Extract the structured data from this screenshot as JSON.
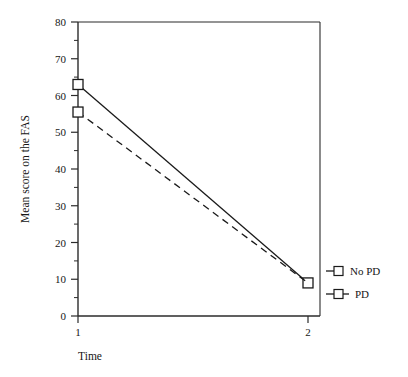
{
  "chart_data": {
    "type": "line",
    "title": "",
    "xlabel": "Time",
    "ylabel": "Mean score on the FAS",
    "x": [
      1,
      2
    ],
    "xticklabels": [
      "1",
      "2"
    ],
    "xlim": [
      1,
      2
    ],
    "ylim": [
      0,
      80
    ],
    "yticks": [
      0,
      10,
      20,
      30,
      40,
      50,
      60,
      70,
      80
    ],
    "yticklabels": [
      "0",
      "10",
      "20",
      "30",
      "40",
      "50",
      "60",
      "70",
      "80"
    ],
    "grid": false,
    "legend_position": "right",
    "series": [
      {
        "name": "No PD",
        "values": [
          63,
          9
        ],
        "linestyle": "solid",
        "marker": "open-square",
        "color": "#1a1a1a"
      },
      {
        "name": "PD",
        "values": [
          55.5,
          9
        ],
        "linestyle": "dashed",
        "marker": "open-square",
        "color": "#1a1a1a"
      }
    ]
  },
  "axes": {
    "y_title": "Mean score on the FAS",
    "x_title": "Time",
    "y_ticks": [
      "80",
      "70",
      "60",
      "50",
      "40",
      "30",
      "20",
      "10",
      "0"
    ],
    "x_ticks": [
      "1",
      "2"
    ]
  },
  "legend": {
    "entries": [
      {
        "label": "No PD"
      },
      {
        "label": "PD"
      }
    ]
  },
  "colors": {
    "line": "#1a1a1a",
    "axis": "#2b2b2b",
    "background": "#ffffff",
    "marker_fill": "#ffffff"
  }
}
